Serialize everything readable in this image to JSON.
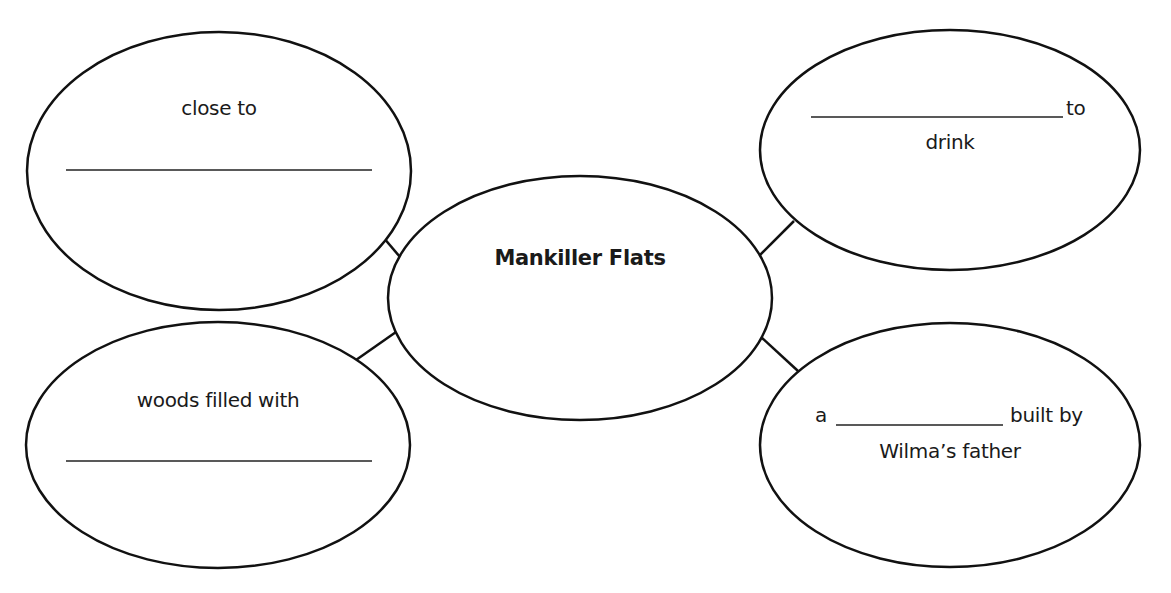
{
  "diagram": {
    "center": {
      "label": "Mankiller Flats"
    },
    "nodes": [
      {
        "id": "top-left",
        "line1": "close to",
        "blank": ""
      },
      {
        "id": "top-right",
        "after_blank": "to",
        "line2": "drink",
        "blank": ""
      },
      {
        "id": "bottom-left",
        "line1": "woods filled with",
        "blank": ""
      },
      {
        "id": "bottom-right",
        "before_blank": "a",
        "after_blank": "built by",
        "line2": "Wilma’s father",
        "blank": ""
      }
    ],
    "colors": {
      "stroke": "#111111",
      "background": "#ffffff",
      "text": "#1a1a1a"
    }
  }
}
